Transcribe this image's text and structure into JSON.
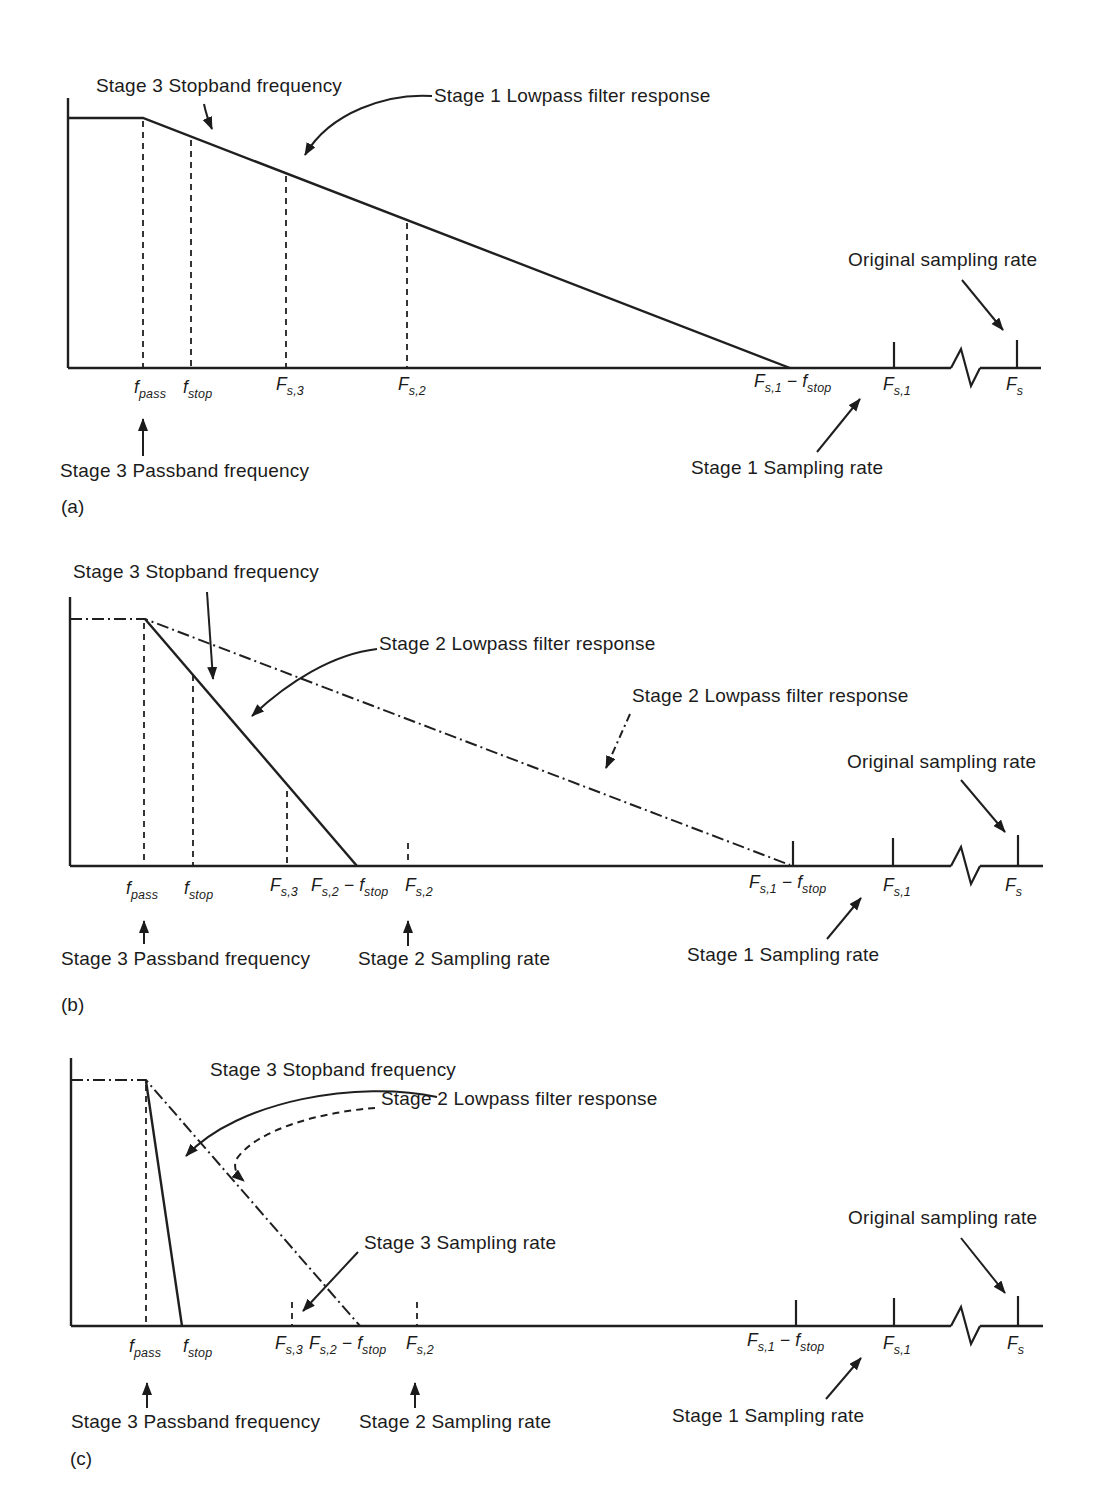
{
  "colors": {
    "ink": "#1b1b1b",
    "background": "#ffffff"
  },
  "annotations": {
    "stage3_stopband": "Stage 3 Stopband frequency",
    "stage1_lowpass": "Stage 1 Lowpass filter response",
    "stage2_lowpass": "Stage 2 Lowpass filter response",
    "original_rate": "Original sampling rate",
    "stage1_rate": "Stage 1 Sampling rate",
    "stage2_rate": "Stage 2 Sampling rate",
    "stage3_rate": "Stage 3 Sampling rate",
    "stage3_passband": "Stage 3 Passband frequency"
  },
  "panel_labels": {
    "a": "(a)",
    "b": "(b)",
    "c": "(c)"
  },
  "math_labels": {
    "fpass": {
      "base": "f",
      "sub": "pass"
    },
    "fstop": {
      "base": "f",
      "sub": "stop"
    },
    "fs3": {
      "base": "F",
      "sub": "s,3"
    },
    "fs2": {
      "base": "F",
      "sub": "s,2"
    },
    "fs1": {
      "base": "F",
      "sub": "s,1"
    },
    "fs": {
      "base": "F",
      "sub": "s"
    },
    "minus": "−"
  }
}
